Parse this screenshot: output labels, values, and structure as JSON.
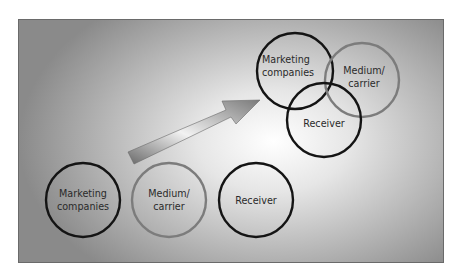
{
  "diagram": {
    "arrow": {
      "from": [
        128,
        158
      ],
      "to": [
        260,
        100
      ]
    },
    "separate": [
      {
        "label_line1": "Marketing",
        "label_line2": "companies",
        "cx": 83,
        "cy": 200,
        "r": 37,
        "stroke": "#141414"
      },
      {
        "label_line1": "Medium/",
        "label_line2": "carrier",
        "cx": 169,
        "cy": 200,
        "r": 37,
        "stroke": "#7c7c7c"
      },
      {
        "label_line1": "Receiver",
        "label_line2": "",
        "cx": 256,
        "cy": 200,
        "r": 37,
        "stroke": "#141414"
      }
    ],
    "overlapping": [
      {
        "label_line1": "Marketing",
        "label_line2": "companies",
        "cx": 295,
        "cy": 71,
        "r": 38,
        "stroke": "#141414"
      },
      {
        "label_line1": "Medium/",
        "label_line2": "carrier",
        "cx": 362,
        "cy": 80,
        "r": 37,
        "stroke": "#7c7c7c"
      },
      {
        "label_line1": "Receiver",
        "label_line2": "",
        "cx": 324,
        "cy": 120,
        "r": 37,
        "stroke": "#141414"
      }
    ]
  }
}
